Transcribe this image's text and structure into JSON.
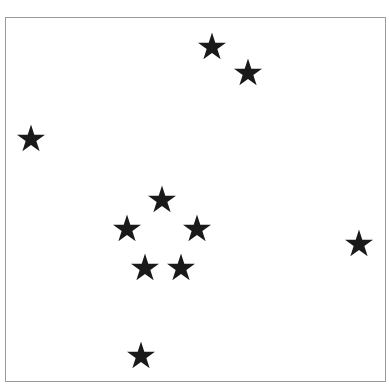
{
  "diagram": {
    "type": "star-field",
    "frame": {
      "x": 5,
      "y": 17,
      "width": 381,
      "height": 365,
      "border_color": "#9a9a9a"
    },
    "star_color": "#1a1a1a",
    "star_count": 10,
    "stars": [
      {
        "id": "star-top-1",
        "x": 212,
        "y": 46
      },
      {
        "id": "star-top-2",
        "x": 248,
        "y": 72
      },
      {
        "id": "star-left",
        "x": 31,
        "y": 138
      },
      {
        "id": "star-cluster-top",
        "x": 162,
        "y": 199
      },
      {
        "id": "star-cluster-left",
        "x": 127,
        "y": 228
      },
      {
        "id": "star-cluster-right",
        "x": 197,
        "y": 228
      },
      {
        "id": "star-cluster-bottom-left",
        "x": 145,
        "y": 267
      },
      {
        "id": "star-cluster-bottom-right",
        "x": 181,
        "y": 267
      },
      {
        "id": "star-right",
        "x": 359,
        "y": 243
      },
      {
        "id": "star-bottom",
        "x": 141,
        "y": 355
      }
    ]
  }
}
